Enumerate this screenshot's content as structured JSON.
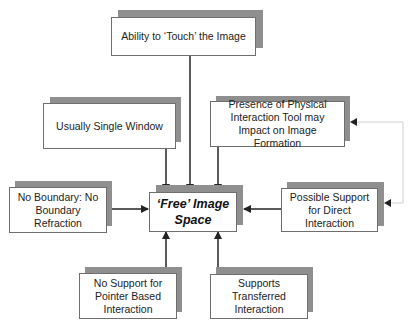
{
  "diagram": {
    "center": {
      "label": "'Free' Image Space"
    },
    "nodes": [
      {
        "id": "touch",
        "label": "Ability to 'Touch' the Image",
        "relation": "points-to-center"
      },
      {
        "id": "single-window",
        "label": "Usually Single Window",
        "relation": "points-to-center"
      },
      {
        "id": "physical-tool",
        "label": "Presence of Physical Interaction Tool may Impact on Image Formation",
        "relation": "points-to-center"
      },
      {
        "id": "no-boundary",
        "label": "No Boundary: No Boundary Refraction",
        "relation": "points-to-center"
      },
      {
        "id": "direct-interaction",
        "label": "Possible Support for Direct Interaction",
        "relation": "points-to-center; also points to physical-tool via light connector"
      },
      {
        "id": "no-pointer",
        "label": "No Support for Pointer Based Interaction",
        "relation": "points-to-center"
      },
      {
        "id": "transferred",
        "label": "Supports Transferred Interaction",
        "relation": "points-to-center"
      }
    ],
    "colors": {
      "shadow": "#8f8f8f",
      "border": "#6e6e6e",
      "arrow": "#222222",
      "light_connector": "#d0d0d0"
    }
  },
  "labels": {
    "center": "‘Free’ Image Space",
    "touch": "Ability to ‘Touch’ the Image",
    "single_window": "Usually Single Window",
    "physical_tool": "Presence of Physical Interaction Tool may Impact on Image Formation",
    "no_boundary": "No Boundary: No Boundary Refraction",
    "direct_interaction": "Possible Support for Direct Interaction",
    "no_pointer": "No Support for Pointer Based Interaction",
    "transferred": "Supports Transferred Interaction"
  }
}
